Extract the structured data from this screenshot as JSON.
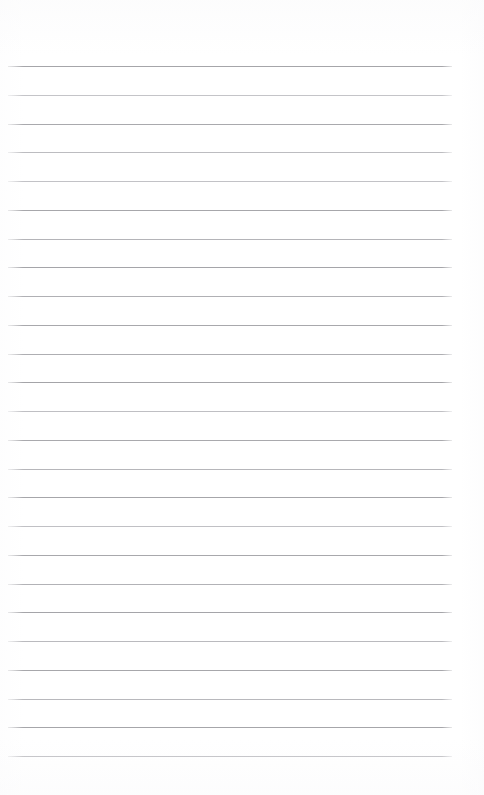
{
  "document": {
    "kind": "blank-ruled-notebook-page",
    "title": "",
    "page_width": 484,
    "page_height": 795,
    "background_color": "#ffffff",
    "has_text_content": false,
    "has_handwriting": false,
    "has_header": false,
    "has_footer": false,
    "has_margin_rule": false,
    "has_page_number": false
  },
  "ruling": {
    "line_color": "#a8a8ac",
    "line_color_faint": "#c9c9cd",
    "line_thickness_px": 1,
    "line_count": 25,
    "first_line_y": 66,
    "line_spacing_px": 28.75,
    "line_start_x": 8,
    "line_end_x": 452,
    "top_margin_px": 66,
    "bottom_margin_px": 39,
    "left_margin_px": 8,
    "right_margin_px": 32
  },
  "lines": [
    {
      "index": 1,
      "y": 66,
      "x1": 8,
      "x2": 452,
      "color": "#a6a6aa",
      "content": ""
    },
    {
      "index": 2,
      "y": 95,
      "x1": 8,
      "x2": 452,
      "color": "#c4c4c8",
      "content": ""
    },
    {
      "index": 3,
      "y": 124,
      "x1": 8,
      "x2": 452,
      "color": "#a9a9ad",
      "content": ""
    },
    {
      "index": 4,
      "y": 152,
      "x1": 8,
      "x2": 452,
      "color": "#bcbcc0",
      "content": ""
    },
    {
      "index": 5,
      "y": 181,
      "x1": 8,
      "x2": 452,
      "color": "#c2c2c6",
      "content": ""
    },
    {
      "index": 6,
      "y": 210,
      "x1": 8,
      "x2": 452,
      "color": "#a7a7ab",
      "content": ""
    },
    {
      "index": 7,
      "y": 239,
      "x1": 8,
      "x2": 452,
      "color": "#b4b4b8",
      "content": ""
    },
    {
      "index": 8,
      "y": 267,
      "x1": 8,
      "x2": 452,
      "color": "#a5a5a9",
      "content": ""
    },
    {
      "index": 9,
      "y": 296,
      "x1": 8,
      "x2": 452,
      "color": "#b0b0b4",
      "content": ""
    },
    {
      "index": 10,
      "y": 325,
      "x1": 8,
      "x2": 452,
      "color": "#a8a8ac",
      "content": ""
    },
    {
      "index": 11,
      "y": 354,
      "x1": 8,
      "x2": 452,
      "color": "#aeaeb2",
      "content": ""
    },
    {
      "index": 12,
      "y": 382,
      "x1": 8,
      "x2": 452,
      "color": "#a4a4a8",
      "content": ""
    },
    {
      "index": 13,
      "y": 411,
      "x1": 8,
      "x2": 452,
      "color": "#bfbfc3",
      "content": ""
    },
    {
      "index": 14,
      "y": 440,
      "x1": 8,
      "x2": 452,
      "color": "#a9a9ad",
      "content": ""
    },
    {
      "index": 15,
      "y": 469,
      "x1": 8,
      "x2": 452,
      "color": "#b6b6ba",
      "content": ""
    },
    {
      "index": 16,
      "y": 497,
      "x1": 8,
      "x2": 452,
      "color": "#a6a6aa",
      "content": ""
    },
    {
      "index": 17,
      "y": 526,
      "x1": 8,
      "x2": 452,
      "color": "#c0c0c4",
      "content": ""
    },
    {
      "index": 18,
      "y": 555,
      "x1": 8,
      "x2": 452,
      "color": "#a8a8ac",
      "content": ""
    },
    {
      "index": 19,
      "y": 584,
      "x1": 8,
      "x2": 452,
      "color": "#b2b2b6",
      "content": ""
    },
    {
      "index": 20,
      "y": 612,
      "x1": 8,
      "x2": 452,
      "color": "#a5a5a9",
      "content": ""
    },
    {
      "index": 21,
      "y": 641,
      "x1": 8,
      "x2": 452,
      "color": "#bababe",
      "content": ""
    },
    {
      "index": 22,
      "y": 670,
      "x1": 8,
      "x2": 452,
      "color": "#a7a7ab",
      "content": ""
    },
    {
      "index": 23,
      "y": 699,
      "x1": 8,
      "x2": 452,
      "color": "#b8b8bc",
      "content": ""
    },
    {
      "index": 24,
      "y": 727,
      "x1": 8,
      "x2": 452,
      "color": "#a6a6aa",
      "content": ""
    },
    {
      "index": 25,
      "y": 756,
      "x1": 8,
      "x2": 452,
      "color": "#bdbdc1",
      "content": ""
    }
  ]
}
